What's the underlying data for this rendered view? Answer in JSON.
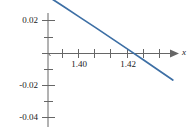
{
  "chart_data": {
    "type": "line",
    "title": "",
    "subtitle": "",
    "xlabel": "x",
    "ylabel": "",
    "grid": false,
    "legend": null,
    "xlim": [
      1.39,
      1.43
    ],
    "ylim": [
      -0.047,
      0.03
    ],
    "x_axis": {
      "label": "x",
      "arrow": true,
      "major_ticks": [
        1.4,
        1.42
      ],
      "major_tick_labels": [
        "1.40",
        "1.42"
      ],
      "minor_ticks": [
        1.39,
        1.395,
        1.405,
        1.41,
        1.415,
        1.425
      ],
      "tick_positions_all": [
        1.39,
        1.395,
        1.4,
        1.405,
        1.41,
        1.415,
        1.42,
        1.425
      ]
    },
    "y_axis": {
      "label": "",
      "major_ticks": [
        0.02,
        -0.02,
        -0.04
      ],
      "major_tick_labels": [
        "0.02",
        "-0.02",
        "-0.04"
      ],
      "minor_ticks": [
        0.01,
        0.0,
        -0.01,
        -0.03
      ],
      "tick_positions_all": [
        0.02,
        0.01,
        0.0,
        -0.01,
        -0.02,
        -0.03,
        -0.04
      ]
    },
    "series": [
      {
        "name": "curve",
        "color": "#3d6fa5",
        "x": [
          1.3915,
          1.395,
          1.4,
          1.405,
          1.41,
          1.415,
          1.42,
          1.425,
          1.429
        ],
        "y": [
          -0.0338,
          -0.0292,
          -0.0226,
          -0.016,
          -0.0093,
          -0.0026,
          0.0042,
          0.0111,
          0.0166
        ],
        "x_intercept": 1.4169
      }
    ],
    "axis_color": "#666666"
  },
  "labels": {
    "y_0p02": "0.02",
    "y_neg0p02": "-0.02",
    "y_neg0p04": "-0.04",
    "x_1p40": "1.40",
    "x_1p42": "1.42",
    "x_axis_name": "x"
  }
}
